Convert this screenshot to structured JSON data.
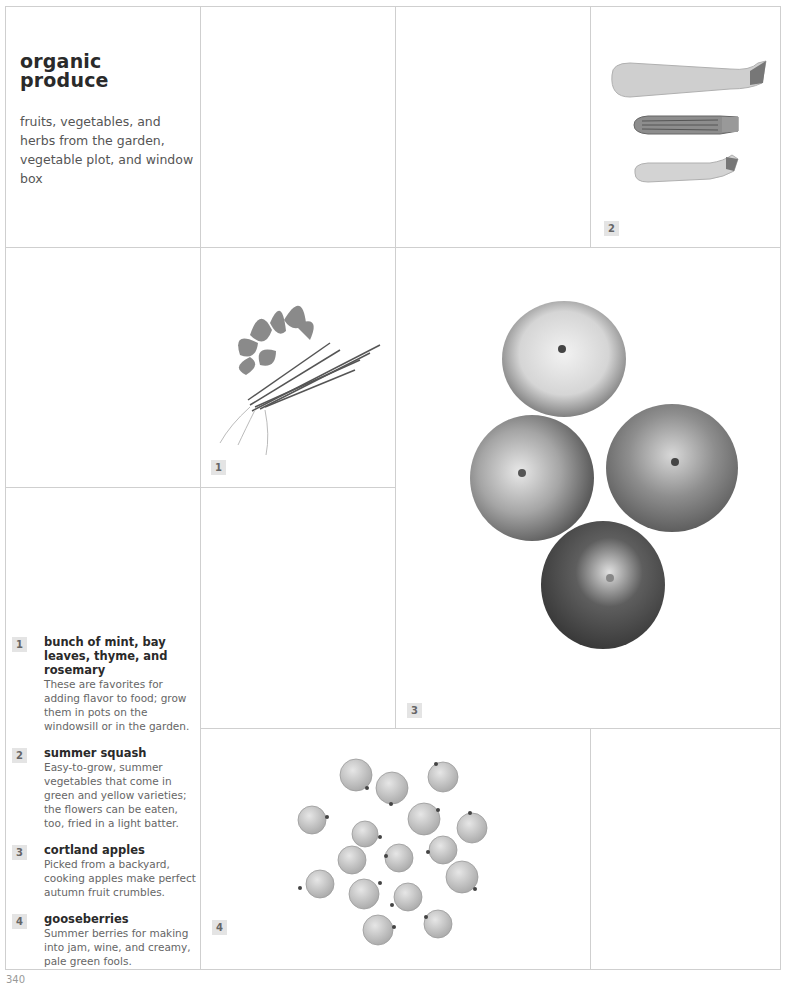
{
  "header": {
    "title_line1": "organic",
    "title_line2": "produce",
    "subtitle": "fruits, vegetables, and herbs from the garden, vegetable plot, and window box"
  },
  "photos": [
    {
      "number": "1",
      "subject": "herb bundle"
    },
    {
      "number": "2",
      "subject": "summer squash"
    },
    {
      "number": "3",
      "subject": "cortland apples"
    },
    {
      "number": "4",
      "subject": "gooseberries"
    }
  ],
  "captions": [
    {
      "number": "1",
      "title": "bunch of mint, bay leaves, thyme, and rosemary",
      "body": "These are favorites for adding flavor to food; grow them in pots on the windowsill or in the garden."
    },
    {
      "number": "2",
      "title": "summer squash",
      "body": "Easy-to-grow, summer vegetables that come in green and yellow varieties; the flowers can be eaten, too, fried in a light batter."
    },
    {
      "number": "3",
      "title": "cortland apples",
      "body": "Picked from a backyard, cooking apples make perfect autumn fruit crumbles."
    },
    {
      "number": "4",
      "title": "gooseberries",
      "body": "Summer berries for making into jam, wine, and creamy, pale green fools."
    }
  ],
  "footer": {
    "page_number": "340"
  }
}
